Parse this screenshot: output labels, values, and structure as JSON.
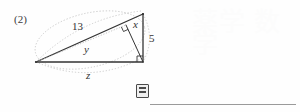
{
  "page": {
    "background_color": "#fefefe",
    "ink_color": "#333333",
    "width": 300,
    "height": 112
  },
  "problem": {
    "number_label": "(2)"
  },
  "watermark": {
    "text": "薬学 数学",
    "color": "#fcfcfc"
  },
  "diagram": {
    "type": "right-triangle-with-altitude",
    "stroke_color": "#333333",
    "dotted_color": "#b9b9b9",
    "labels": [
      {
        "name": "hypotenuse",
        "text": "13",
        "style": "number",
        "x": 72,
        "y": 20
      },
      {
        "name": "altitude",
        "text": "x",
        "style": "variable",
        "x": 133,
        "y": 18
      },
      {
        "name": "leg",
        "text": "5",
        "style": "number",
        "x": 149,
        "y": 32
      },
      {
        "name": "segment-y",
        "text": "y",
        "style": "variable",
        "x": 84,
        "y": 43
      },
      {
        "name": "base-z",
        "text": "z",
        "style": "variable",
        "x": 86,
        "y": 69
      }
    ],
    "vertices": {
      "left": [
        36,
        62
      ],
      "top_right": [
        143,
        14
      ],
      "bottom_right": [
        143,
        62
      ],
      "foot_of_altitude": [
        126,
        25
      ]
    },
    "right_angle_marks": [
      {
        "name": "right-angle-altitude",
        "at": [
          126,
          25
        ]
      },
      {
        "name": "right-angle-corner",
        "at": [
          143,
          62
        ]
      }
    ]
  },
  "answer": {
    "icon_name": "answer-box-icon",
    "value": "",
    "placeholder": ""
  }
}
